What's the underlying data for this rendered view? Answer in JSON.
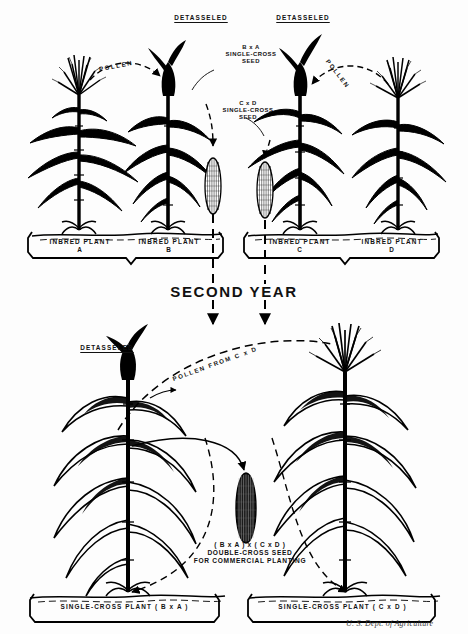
{
  "figure": {
    "title_credit": "U. S. Dept. of Agriculture",
    "divider_label": "SECOND YEAR"
  },
  "first_year": {
    "detasseled_left": "DETASSELED",
    "detasseled_right": "DETASSELED",
    "pollen_left": "POLLEN",
    "pollen_right": "POLLEN",
    "seed_ba": {
      "line1": "B x A",
      "line2": "SINGLE-CROSS",
      "line3": "SEED"
    },
    "seed_cd": {
      "line1": "C x D",
      "line2": "SINGLE-CROSS",
      "line3": "SEED"
    },
    "plants": [
      {
        "caption": "INBRED PLANT",
        "letter": "A"
      },
      {
        "caption": "INBRED PLANT",
        "letter": "B"
      },
      {
        "caption": "INBRED PLANT",
        "letter": "C"
      },
      {
        "caption": "INBRED PLANT",
        "letter": "D"
      }
    ]
  },
  "second_year": {
    "detasseled": "DETASSELED",
    "pollen_from": "POLLEN FROM C x D",
    "double_cross": {
      "line1": "( B x A ) x ( C x D )",
      "line2": "DOUBLE-CROSS SEED",
      "line3": "FOR COMMERCIAL PLANTING"
    },
    "plants": [
      {
        "caption": "SINGLE-CROSS PLANT ( B x A )"
      },
      {
        "caption": "SINGLE-CROSS PLANT ( C x D )"
      }
    ]
  },
  "colors": {
    "ink": "#000000",
    "paper": "#fdfdfd",
    "credit": "#3a3a3a"
  }
}
